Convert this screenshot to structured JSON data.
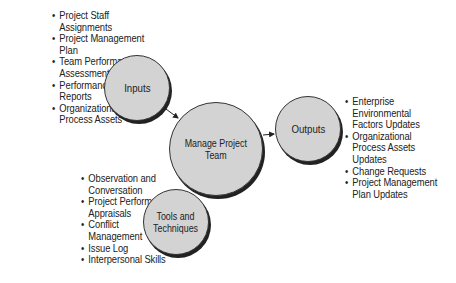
{
  "diagram": {
    "center": {
      "label": "Manage Project\nTeam",
      "line1": "Manage Project",
      "line2": "Team"
    },
    "inputs": {
      "label": "Inputs",
      "items": [
        "Project Staff Assignments",
        "Project Management Plan",
        "Team Performance Assessments",
        "Performance Reports",
        "Organizational Process Assets"
      ],
      "lines": [
        [
          "Project Staff",
          "Assignments"
        ],
        [
          "Project Management",
          "Plan"
        ],
        [
          "Team Performance",
          "Assessments"
        ],
        [
          "Performance",
          "Reports"
        ],
        [
          "Organizational",
          "Process Assets"
        ]
      ]
    },
    "tools": {
      "label_line1": "Tools and",
      "label_line2": "Techniques",
      "items": [
        "Observation and Conversation",
        "Project Performance Appraisals",
        "Conflict Management",
        "Issue Log",
        "Interpersonal Skills"
      ],
      "lines": [
        [
          "Observation and",
          "Conversation"
        ],
        [
          "Project Performance",
          "Appraisals"
        ],
        [
          "Conflict",
          "Management"
        ],
        [
          "Issue Log"
        ],
        [
          "Interpersonal Skills"
        ]
      ]
    },
    "outputs": {
      "label": "Outputs",
      "items": [
        "Enterprise Environmental Factors Updates",
        "Organizational Process Assets Updates",
        "Change Requests",
        "Project Management Plan Updates"
      ],
      "lines": [
        [
          "Enterprise",
          "Environmental",
          "Factors Updates"
        ],
        [
          "Organizational",
          "Process Assets",
          "Updates"
        ],
        [
          "Change Requests"
        ],
        [
          "Project Management",
          "Plan Updates"
        ]
      ]
    },
    "colors": {
      "circle_fill": "#d3d3d3",
      "outline": "#333333",
      "text": "#222222"
    }
  }
}
